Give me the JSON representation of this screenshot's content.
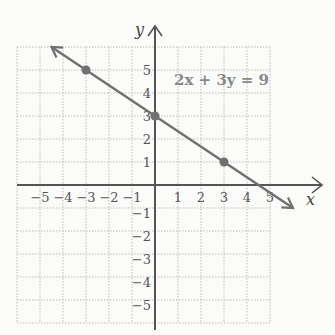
{
  "chart_data": {
    "type": "line",
    "title": "",
    "xlabel": "x",
    "ylabel": "y",
    "xlim": [
      -6,
      6
    ],
    "ylim": [
      -6,
      6
    ],
    "grid": true,
    "x_ticks": [
      "-5",
      "-4",
      "-3",
      "-2",
      "-1",
      "1",
      "2",
      "3",
      "4",
      "5"
    ],
    "y_ticks": [
      "5",
      "4",
      "3",
      "2",
      "1",
      "-1",
      "-2",
      "-3",
      "-4",
      "-5"
    ],
    "equation_label": "2x + 3y = 9",
    "series": [
      {
        "name": "2x + 3y = 9",
        "x": [
          -4.5,
          6
        ],
        "y": [
          6,
          -1
        ]
      }
    ],
    "points": [
      {
        "x": -3,
        "y": 5
      },
      {
        "x": 0,
        "y": 3
      },
      {
        "x": 3,
        "y": 1
      }
    ],
    "colors": {
      "line": "#707070",
      "grid": "#bdbdbd",
      "axis": "#555555"
    }
  }
}
